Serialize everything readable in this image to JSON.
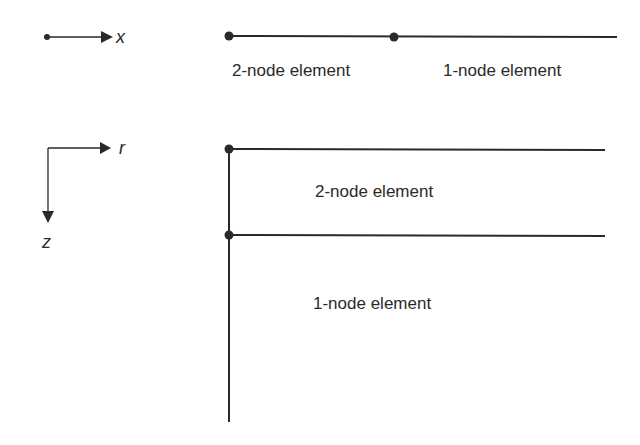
{
  "figure": {
    "colors": {
      "stroke": "#2a2a2a",
      "text": "#2a2a2a",
      "background": "#ffffff"
    },
    "panel_1d": {
      "axis": {
        "label": "x",
        "icon": "arrow-right-icon"
      },
      "elements": [
        {
          "label": "2-node element"
        },
        {
          "label": "1-node element"
        }
      ]
    },
    "panel_2d": {
      "axes": {
        "horizontal": {
          "label": "r",
          "icon": "arrow-right-icon"
        },
        "vertical": {
          "label": "z",
          "icon": "arrow-down-icon"
        }
      },
      "elements": [
        {
          "label": "2-node element"
        },
        {
          "label": "1-node element"
        }
      ]
    }
  }
}
